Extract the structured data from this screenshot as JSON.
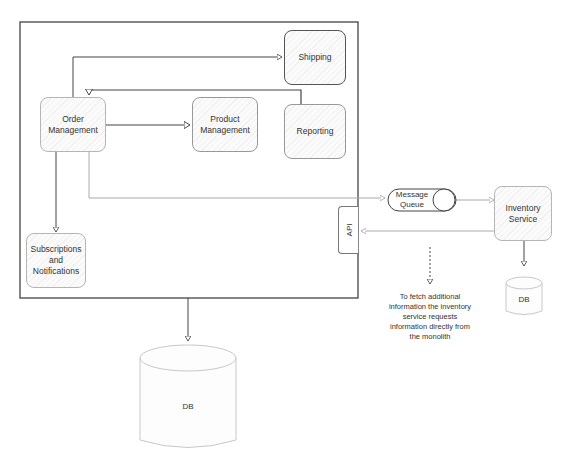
{
  "diagram": {
    "title": "",
    "monolith": {
      "components": [
        {
          "id": "shipping",
          "label": "Shipping"
        },
        {
          "id": "order",
          "label": "Order\nManagement"
        },
        {
          "id": "product",
          "label": "Product\nManagement"
        },
        {
          "id": "reporting",
          "label": "Reporting"
        },
        {
          "id": "subscriptions",
          "label": "Subscriptions\nand\nNotifications"
        }
      ],
      "api_label": "API",
      "db_label": "DB"
    },
    "message_queue": {
      "label": "Message\nQueue"
    },
    "inventory_service": {
      "label": "Inventory\nService",
      "db_label": "DB"
    },
    "annotation": "To fetch additional\ninformation the inventory\nservice requests\ninformation directly from\nthe monolith",
    "edges": [
      {
        "from": "order",
        "to": "shipping"
      },
      {
        "from": "reporting",
        "to": "order"
      },
      {
        "from": "order",
        "to": "product"
      },
      {
        "from": "order",
        "to": "subscriptions"
      },
      {
        "from": "order",
        "to": "message_queue"
      },
      {
        "from": "message_queue",
        "to": "inventory_service"
      },
      {
        "from": "inventory_service",
        "to": "api"
      },
      {
        "from": "inventory_service",
        "to": "inventory_db"
      },
      {
        "from": "monolith",
        "to": "monolith_db"
      }
    ]
  }
}
